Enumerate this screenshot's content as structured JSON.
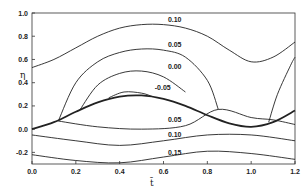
{
  "chart_data": {
    "type": "line",
    "title": "",
    "xlabel": "t̄",
    "ylabel": "η",
    "xlim": [
      0.0,
      1.2
    ],
    "ylim": [
      -0.3,
      1.0
    ],
    "grid": false,
    "legend": "none (inline contour labels)",
    "x_ticks": [
      "0.0",
      "0.2",
      "0.4",
      "0.6",
      "0.8",
      "1.0",
      "1.2"
    ],
    "y_ticks": [
      "-0.2",
      "0.0",
      "0.2",
      "0.4",
      "0.6",
      "0.8",
      "1.0"
    ],
    "series": [
      {
        "name": "0.10 (upper)",
        "label": "0.10",
        "x": [
          0.0,
          0.1,
          0.2,
          0.3,
          0.4,
          0.5,
          0.6,
          0.7,
          0.8,
          0.9,
          1.0,
          1.1,
          1.2
        ],
        "y": [
          0.53,
          0.6,
          0.7,
          0.8,
          0.87,
          0.9,
          0.9,
          0.87,
          0.8,
          0.68,
          0.58,
          0.62,
          0.75
        ]
      },
      {
        "name": "0.05 (upper)",
        "label": "0.05",
        "x": [
          0.12,
          0.2,
          0.3,
          0.4,
          0.5,
          0.6,
          0.7,
          0.8,
          0.85
        ],
        "y": [
          0.07,
          0.4,
          0.58,
          0.66,
          0.69,
          0.68,
          0.62,
          0.42,
          0.17
        ]
      },
      {
        "name": "0.00",
        "label": "0.00",
        "x": [
          0.22,
          0.3,
          0.4,
          0.5,
          0.6,
          0.7
        ],
        "y": [
          0.17,
          0.38,
          0.48,
          0.5,
          0.45,
          0.32
        ]
      },
      {
        "name": "-0.05",
        "label": "-0.05",
        "x": [
          0.35,
          0.42,
          0.5,
          0.55
        ],
        "y": [
          0.27,
          0.32,
          0.31,
          0.28
        ]
      },
      {
        "name": "boundary (bold)",
        "label": "",
        "x": [
          0.0,
          0.1,
          0.2,
          0.3,
          0.4,
          0.5,
          0.6,
          0.7,
          0.8,
          0.9,
          1.0,
          1.1,
          1.2
        ],
        "y": [
          0.0,
          0.06,
          0.15,
          0.23,
          0.28,
          0.29,
          0.26,
          0.2,
          0.12,
          0.05,
          0.02,
          0.06,
          0.16
        ]
      },
      {
        "name": "0.05 (lower)",
        "label": "0.05",
        "x": [
          0.12,
          0.3,
          0.5,
          0.7,
          0.85,
          1.0,
          1.1,
          1.2
        ],
        "y": [
          0.07,
          0.02,
          0.0,
          0.03,
          0.17,
          0.1,
          0.08,
          0.04
        ]
      },
      {
        "name": "0.10 (lower)",
        "label": "0.10",
        "x": [
          0.0,
          0.2,
          0.4,
          0.6,
          0.8,
          1.0,
          1.2
        ],
        "y": [
          -0.05,
          -0.1,
          -0.14,
          -0.1,
          -0.05,
          -0.05,
          -0.1
        ]
      },
      {
        "name": "0.15",
        "label": "0.15",
        "x": [
          0.0,
          0.2,
          0.4,
          0.6,
          0.8,
          1.0,
          1.2
        ],
        "y": [
          -0.22,
          -0.27,
          -0.29,
          -0.24,
          -0.19,
          -0.21,
          -0.26
        ]
      },
      {
        "name": "0.05 right branch",
        "label": "",
        "x": [
          1.08,
          1.12,
          1.18,
          1.2
        ],
        "y": [
          0.06,
          0.3,
          0.55,
          0.62
        ]
      }
    ],
    "annotations": [
      {
        "text": "0.10",
        "x": 0.62,
        "y": 0.92
      },
      {
        "text": "0.05",
        "x": 0.62,
        "y": 0.71
      },
      {
        "text": "0.00",
        "x": 0.62,
        "y": 0.52
      },
      {
        "text": "-0.05",
        "x": 0.56,
        "y": 0.34
      },
      {
        "text": "0.05",
        "x": 0.62,
        "y": 0.06
      },
      {
        "text": "0.10",
        "x": 0.62,
        "y": -0.07
      },
      {
        "text": "0.15",
        "x": 0.62,
        "y": -0.22
      }
    ]
  }
}
